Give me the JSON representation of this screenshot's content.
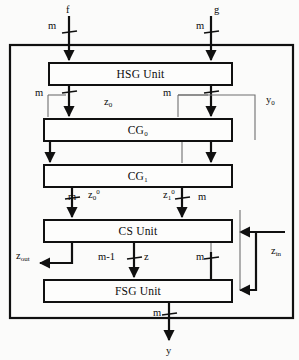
{
  "diagram": {
    "type": "block-diagram",
    "colors": {
      "line": "#101010",
      "thin_line": "#6f6f6f",
      "box_fill": "#fdfdfc",
      "background": "#fbfbfa"
    },
    "outer_boundary": {
      "name": "system-boundary",
      "x": 10,
      "y": 45,
      "width": 283,
      "height": 273
    },
    "blocks": [
      {
        "id": "hsg",
        "label": "HSG Unit",
        "x": 48,
        "y": 62,
        "width": 185,
        "height": 24
      },
      {
        "id": "cg0",
        "label": "CG₀",
        "x": 43,
        "y": 118,
        "width": 190,
        "height": 24
      },
      {
        "id": "cg1",
        "label": "CG₁",
        "x": 43,
        "y": 164,
        "width": 190,
        "height": 24
      },
      {
        "id": "cs",
        "label": "CS Unit",
        "x": 43,
        "y": 219,
        "width": 190,
        "height": 24
      },
      {
        "id": "fsg",
        "label": "FSG Unit",
        "x": 43,
        "y": 279,
        "width": 190,
        "height": 24
      }
    ],
    "external_inputs": [
      {
        "id": "f",
        "label": "f",
        "x": 66,
        "y": 5
      },
      {
        "id": "g",
        "label": "g",
        "x": 214,
        "y": 5
      }
    ],
    "external_output": {
      "id": "y",
      "label": "y",
      "x": 166,
      "y": 346
    },
    "bus_labels": [
      {
        "id": "bus-f-width",
        "label": "m",
        "x": 48,
        "y": 21
      },
      {
        "id": "bus-g-width",
        "label": "m",
        "x": 196,
        "y": 21
      },
      {
        "id": "bus-hsg-left",
        "label": "m",
        "x": 35,
        "y": 95
      },
      {
        "id": "bus-hsg-right",
        "label": "m",
        "x": 163,
        "y": 95
      },
      {
        "id": "bus-cs-in-left",
        "label": "m",
        "x": 68,
        "y": 196
      },
      {
        "id": "bus-cs-in-right",
        "label": "m",
        "x": 198,
        "y": 196
      },
      {
        "id": "bus-z-width",
        "label": "m-1",
        "x": 98,
        "y": 256
      },
      {
        "id": "bus-fsg-right",
        "label": "m",
        "x": 196,
        "y": 256
      },
      {
        "id": "bus-y-width",
        "label": "m",
        "x": 153,
        "y": 312
      }
    ],
    "signal_labels": [
      {
        "id": "z0",
        "text_html": "z<sub>0</sub>",
        "x": 104,
        "y": 101
      },
      {
        "id": "y0",
        "text_html": "y<sub>0</sub>",
        "x": 266,
        "y": 99
      },
      {
        "id": "z0sup",
        "text_html": "z<sub>0</sub><sup>0</sup>",
        "x": 88,
        "y": 194
      },
      {
        "id": "z1sup",
        "text_html": "z<sub>1</sub><sup>0</sup>",
        "x": 163,
        "y": 194
      },
      {
        "id": "zout",
        "text_html": "z<sub>out</sub>",
        "x": 16,
        "y": 255
      },
      {
        "id": "z",
        "text_html": "z",
        "x": 144,
        "y": 256
      },
      {
        "id": "zin",
        "text_html": "z<sub>in</sub>",
        "x": 271,
        "y": 250
      }
    ],
    "signal_plain": {
      "z0": "z0",
      "y0": "y0",
      "z0_sup0": "z0^0",
      "z1_sup0": "z1^0",
      "z_out": "zout",
      "z_in": "zin",
      "z": "z",
      "m": "m",
      "m_minus_1": "m-1",
      "f": "f",
      "g": "g",
      "y": "y"
    }
  }
}
